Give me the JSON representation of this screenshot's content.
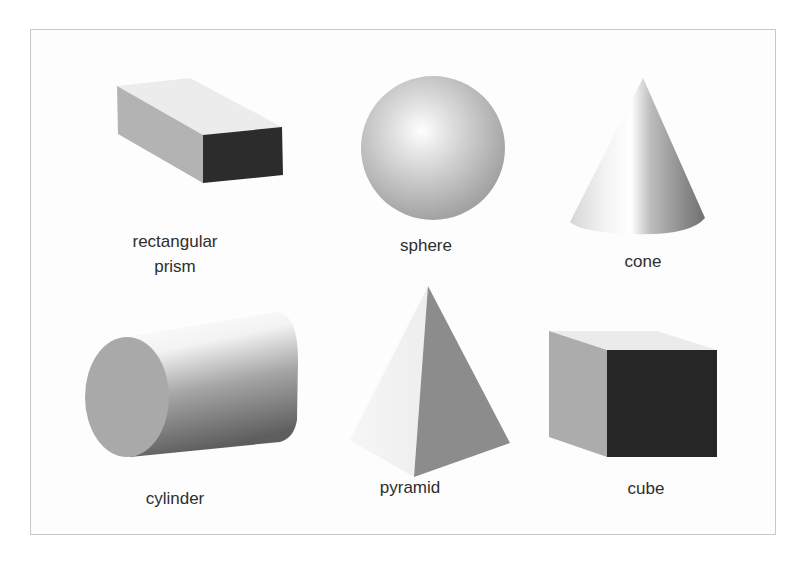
{
  "figure": {
    "title": "",
    "shapes": [
      {
        "id": "rectangular-prism",
        "label_line1": "rectangular",
        "label_line2": "prism"
      },
      {
        "id": "sphere",
        "label": "sphere"
      },
      {
        "id": "cone",
        "label": "cone"
      },
      {
        "id": "cylinder",
        "label": "cylinder"
      },
      {
        "id": "pyramid",
        "label": "pyramid"
      },
      {
        "id": "cube",
        "label": "cube"
      }
    ],
    "colors": {
      "border": "#c8c8c8",
      "text": "#2e2e2e",
      "dark_face": "#2a2a2a",
      "mid_face": "#a8a8a8",
      "light_face": "#ececec",
      "pyramid_face": "#8a8a8a"
    }
  }
}
